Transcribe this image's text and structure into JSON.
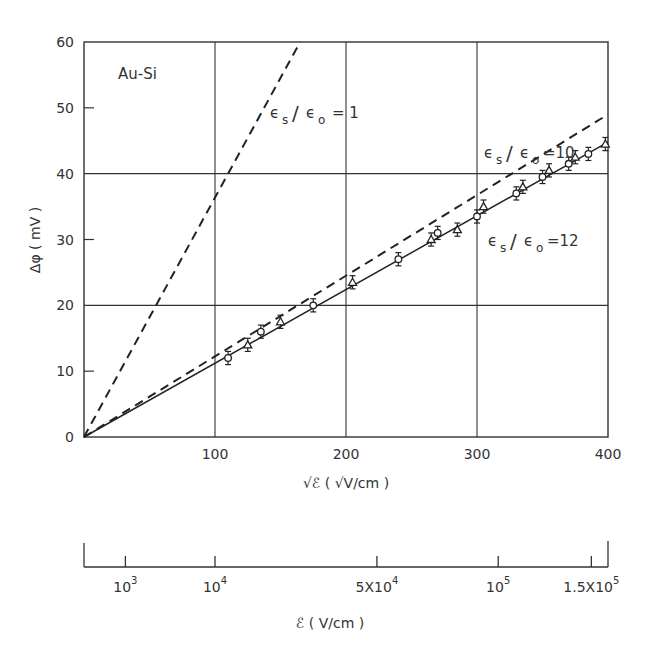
{
  "chart_data": {
    "type": "scatter",
    "title": "",
    "xlabel": "√ℰ ( √V/cm )",
    "ylabel": "Δφ ( mV )",
    "xlim": [
      0,
      400
    ],
    "ylim": [
      0,
      60
    ],
    "grid": true,
    "x_ticks": [
      100,
      200,
      300,
      400
    ],
    "y_ticks": [
      0,
      10,
      20,
      30,
      40,
      50,
      60
    ],
    "annotations": {
      "sample": "Au-Si",
      "line1": "εs/εo = 1",
      "line10": "εs/εo = 10",
      "line12": "εs/εo = 12"
    },
    "series": [
      {
        "name": "Measured Au-Si",
        "style": "markers with error bars (circles and triangles)",
        "x": [
          110,
          125,
          135,
          150,
          175,
          205,
          240,
          265,
          270,
          285,
          300,
          305,
          330,
          335,
          350,
          355,
          370,
          375,
          385,
          398
        ],
        "y": [
          12,
          14,
          16,
          17.5,
          20,
          23.5,
          27,
          30,
          31,
          31.5,
          33.5,
          35,
          37,
          38,
          39.5,
          40.5,
          41.5,
          42.5,
          43,
          44.5
        ],
        "error": 1
      },
      {
        "name": "εs/εo = 1",
        "style": "dashed",
        "x": [
          0,
          165
        ],
        "y": [
          0,
          60
        ]
      },
      {
        "name": "εs/εo = 10",
        "style": "dashed",
        "x": [
          0,
          400
        ],
        "y": [
          0,
          49
        ]
      },
      {
        "name": "εs/εo = 12",
        "style": "solid",
        "x": [
          0,
          400
        ],
        "y": [
          0,
          44.8
        ]
      }
    ],
    "secondary_axis": {
      "label": "ℰ ( V/cm )",
      "ticks": [
        {
          "value": 1000,
          "sqrt": 31.6,
          "label_base": "10",
          "label_exp": "3"
        },
        {
          "value": 10000,
          "sqrt": 100,
          "label_base": "10",
          "label_exp": "4"
        },
        {
          "value": 50000,
          "sqrt": 223.6,
          "label_base": "5X10",
          "label_exp": "4"
        },
        {
          "value": 100000,
          "sqrt": 316.2,
          "label_base": "10",
          "label_exp": "5"
        },
        {
          "value": 150000,
          "sqrt": 387.3,
          "label_base": "1.5X10",
          "label_exp": "5"
        }
      ]
    }
  }
}
